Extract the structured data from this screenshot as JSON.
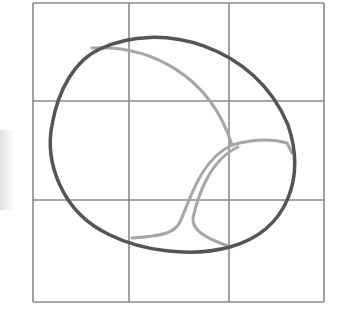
{
  "figure": {
    "grid": {
      "x_lines": [
        33,
        129,
        229,
        324
      ],
      "y_lines": [
        3,
        101,
        200,
        302
      ],
      "color": "#8a8a8a"
    },
    "outline": {
      "color": "#555555",
      "path": "M 100 49 C 160 20, 255 45, 288 125 C 305 175, 290 230, 230 247 C 190 258, 140 250, 110 235 C 60 212, 45 160, 52 125 C 58 90, 75 60, 100 49 Z"
    },
    "seams": {
      "color": "#a6a6a6",
      "paths": [
        "M 92 48 C 150 45, 210 75, 232 145",
        "M 232 145 C 250 140, 270 138, 287 143",
        "M 232 145 C 200 160, 190 200, 180 222 C 175 232, 165 236, 132 238",
        "M 238 147 C 210 160, 198 195, 193 218 C 192 230, 205 238, 228 246",
        "M 287 143 L 292 153"
      ]
    }
  }
}
